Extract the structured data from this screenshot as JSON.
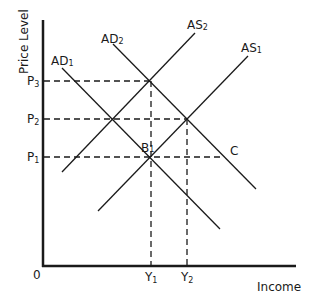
{
  "diagram": {
    "title": "",
    "y_axis_label": "Price Level",
    "x_axis_label": "Income",
    "origin_label": "0",
    "price_levels": [
      {
        "name": "P",
        "sub": "3",
        "y": 81
      },
      {
        "name": "P",
        "sub": "2",
        "y": 119
      },
      {
        "name": "P",
        "sub": "1",
        "y": 157
      }
    ],
    "income_levels": [
      {
        "name": "Y",
        "sub": "1",
        "x": 151
      },
      {
        "name": "Y",
        "sub": "2",
        "x": 187
      }
    ],
    "curves": [
      {
        "id": "AD1",
        "label": "AD",
        "sub": "1"
      },
      {
        "id": "AD2",
        "label": "AD",
        "sub": "2"
      },
      {
        "id": "AS1",
        "label": "AS",
        "sub": "1"
      },
      {
        "id": "AS2",
        "label": "AS",
        "sub": "2"
      }
    ],
    "points": [
      {
        "label": "B",
        "sub": "1"
      },
      {
        "label": "C"
      }
    ],
    "colors": {
      "line": "#1a1a1a",
      "background": "#ffffff"
    }
  }
}
